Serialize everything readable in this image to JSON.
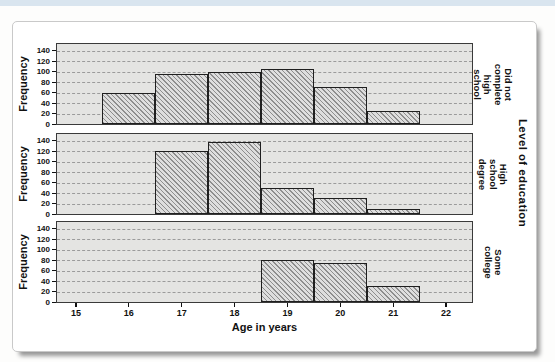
{
  "page": {
    "top_strip": {
      "color": "#d9e5ef"
    }
  },
  "figure": {
    "background": "#ffffff",
    "border_color": "#c9c9c9",
    "shadow_color": "#979797"
  },
  "chart_data": {
    "type": "bar",
    "variant": "paneled-histogram",
    "title": "",
    "xlabel": "Age in years",
    "ylabel": "Frequency",
    "panel_variable": "Level of education",
    "x_ticks": [
      15,
      16,
      17,
      18,
      19,
      20,
      21,
      22
    ],
    "y_ticks": [
      0,
      20,
      40,
      60,
      80,
      100,
      120,
      140
    ],
    "ylim": [
      0,
      155
    ],
    "xlim": [
      14.6,
      22.5
    ],
    "grid": "horizontal-dashed",
    "legend": "none",
    "panels": [
      {
        "label": "Did not complete high school",
        "label_lines": [
          "Did not",
          "complete high",
          "school"
        ],
        "bins": [
          {
            "age": 16,
            "frequency": 60
          },
          {
            "age": 17,
            "frequency": 95
          },
          {
            "age": 18,
            "frequency": 100
          },
          {
            "age": 19,
            "frequency": 105
          },
          {
            "age": 20,
            "frequency": 70
          },
          {
            "age": 21,
            "frequency": 25
          }
        ]
      },
      {
        "label": "High school degree",
        "label_lines": [
          "High school",
          "degree"
        ],
        "bins": [
          {
            "age": 17,
            "frequency": 120
          },
          {
            "age": 18,
            "frequency": 138
          },
          {
            "age": 19,
            "frequency": 50
          },
          {
            "age": 20,
            "frequency": 30
          },
          {
            "age": 21,
            "frequency": 10
          }
        ]
      },
      {
        "label": "Some college",
        "label_lines": [
          "Some college"
        ],
        "bins": [
          {
            "age": 19,
            "frequency": 80
          },
          {
            "age": 20,
            "frequency": 75
          },
          {
            "age": 21,
            "frequency": 30
          }
        ]
      }
    ],
    "colors": {
      "panel_bg": "#e4e4e2",
      "panel_border": "#3a3a3a",
      "gridline": "#9b9b9b",
      "bar_border": "#1f1f1f",
      "bar_hatch_fg": "#8d8d8d",
      "bar_hatch_bg": "#dedede",
      "text": "#111111"
    }
  }
}
